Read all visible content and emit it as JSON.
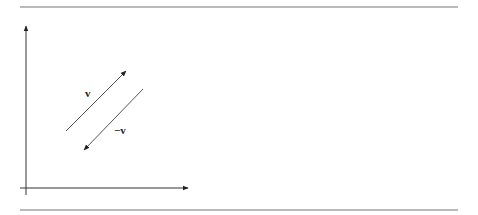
{
  "diagram": {
    "type": "vector-diagram",
    "vectors": [
      {
        "name": "v",
        "label": "v",
        "from": [
          66,
          131
        ],
        "to": [
          126,
          71
        ]
      },
      {
        "name": "neg-v",
        "label": "−v",
        "from": [
          143,
          89
        ],
        "to": [
          84,
          150
        ]
      }
    ],
    "axes": {
      "origin": [
        25,
        188
      ],
      "x_end": [
        188,
        188
      ],
      "y_end": [
        25,
        25
      ]
    },
    "rules": {
      "top_y": 7,
      "bottom_y": 210,
      "x_start": 20,
      "x_end": 458
    },
    "colors": {
      "line": "#555555",
      "axis": "#333333",
      "rule": "#777777"
    }
  }
}
